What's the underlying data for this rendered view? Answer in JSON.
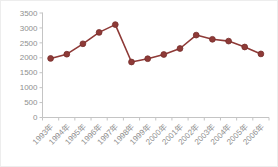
{
  "chart_data": {
    "type": "line",
    "title": "",
    "xlabel": "",
    "ylabel": "",
    "categories": [
      "1993年",
      "1994年",
      "1995年",
      "1996年",
      "1997年",
      "1998年",
      "1999年",
      "2000年",
      "2001年",
      "2002年",
      "2003年",
      "2004年",
      "2005年",
      "2006年"
    ],
    "series": [
      {
        "name": "",
        "values": [
          1980,
          2120,
          2470,
          2850,
          3110,
          1860,
          1970,
          2110,
          2310,
          2760,
          2620,
          2560,
          2360,
          2130
        ]
      }
    ],
    "ylim": [
      0,
      3500
    ],
    "ytick_step": 500,
    "ytick_labels": [
      "0",
      "500",
      "1000",
      "1500",
      "2000",
      "2500",
      "3000",
      "3500"
    ],
    "grid": false,
    "legend": null,
    "x_label_rotation": -45,
    "marker": "circle",
    "colors": {
      "line": "#8e3a37",
      "marker_fill": "#8e3a37",
      "marker_edge": "#772f2c",
      "axis": "#c4c4c4",
      "tick_label": "#8f8f8f",
      "background": "#ffffff"
    }
  }
}
